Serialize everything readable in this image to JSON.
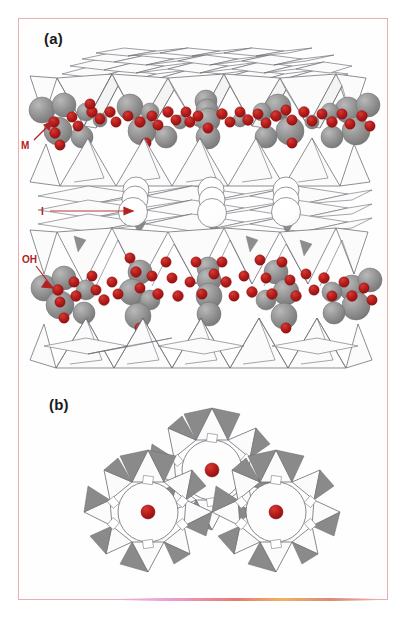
{
  "figure": {
    "frame_color": "#eeabb0",
    "background_color": "#ffffff"
  },
  "panels": [
    {
      "id": "a",
      "label": "(a)",
      "view": "side view of the 2:1 TOT layer stack with interlayer cations"
    },
    {
      "id": "b",
      "label": "(b)",
      "view": "plan view of the hexagonal rings of SiO4 tetrahedra"
    }
  ],
  "annotations": {
    "M": {
      "label": "M",
      "color": "#b22222",
      "meaning": "octahedral metal cation site",
      "arrow": "diagonal-up-right"
    },
    "I": {
      "label": "I",
      "color": "#b22222",
      "meaning": "interlayer cation site",
      "arrow": "horizontal-right"
    },
    "OH": {
      "label": "OH",
      "color": "#b22222",
      "meaning": "hydroxyl group",
      "arrow": "diagonal-down-right"
    }
  },
  "legend_colors": {
    "octahedral_cation_sphere": "#8c8c8c",
    "oxygen_hydroxyl_sphere": "#b51b1b",
    "interlayer_cation_sphere": "#ffffff",
    "tetrahedron_face_light": "#fbfbfb",
    "tetrahedron_face_shaded": "#7f7f7f",
    "polyhedron_outline": "#6a6a72"
  },
  "structure_counts": {
    "panel_b_rings": 3,
    "panel_b_central_cations": 3,
    "panel_a_interlayer_cations": 3,
    "panel_a_tetrahedral_sheets": 4
  }
}
